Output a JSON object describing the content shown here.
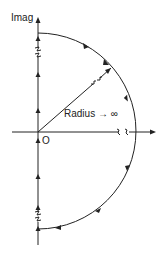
{
  "diagram": {
    "labels": {
      "imag_axis": "Imag",
      "origin": "O",
      "radius": "Radius → ∞"
    },
    "geometry": {
      "origin": [
        38,
        132
      ],
      "radius": 98,
      "vertical_axis": {
        "x": 38,
        "y_top": 18,
        "y_bottom": 245
      },
      "horizontal_axis": {
        "y": 132,
        "x_left": 12,
        "x_right": 156
      }
    },
    "colors": {
      "line": "#222222",
      "background": "#ffffff"
    },
    "contour_direction": "clockwise",
    "features": [
      "vertical imaginary axis with upward arrows",
      "semicircle of infinite radius with clockwise arrows",
      "radius line from origin to arc",
      "break marks indicating infinite extent"
    ]
  }
}
